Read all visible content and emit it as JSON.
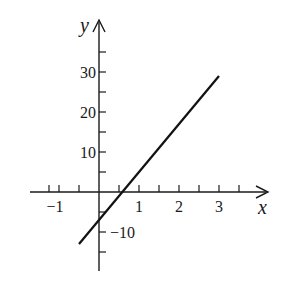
{
  "chart_data": {
    "type": "line",
    "title": "",
    "xlabel": "x",
    "ylabel": "y",
    "xlim": [
      -1.5,
      3.75
    ],
    "ylim": [
      -18,
      40
    ],
    "grid": false,
    "x_tick_labels": [
      {
        "value": -1,
        "label": "-1"
      },
      {
        "value": 1,
        "label": "1"
      },
      {
        "value": 2,
        "label": "2"
      },
      {
        "value": 3,
        "label": "3"
      }
    ],
    "y_tick_labels": [
      {
        "value": 30,
        "label": "30"
      },
      {
        "value": 20,
        "label": "20"
      },
      {
        "value": 10,
        "label": "10"
      },
      {
        "value": -10,
        "label": "-10"
      }
    ],
    "x_minor_ticks": [
      -1.25,
      -1,
      -0.5,
      0.5,
      1,
      1.5,
      2,
      2.5,
      3,
      3.5
    ],
    "y_minor_ticks": [
      -15,
      -10,
      -5,
      5,
      10,
      15,
      20,
      25,
      30,
      35
    ],
    "series": [
      {
        "name": "y = 12x - 7",
        "x": [
          -0.5,
          3
        ],
        "y": [
          -13,
          29
        ]
      }
    ],
    "colors": {
      "axis": "#1a1a1a",
      "line": "#111111",
      "background": "#ffffff"
    }
  }
}
